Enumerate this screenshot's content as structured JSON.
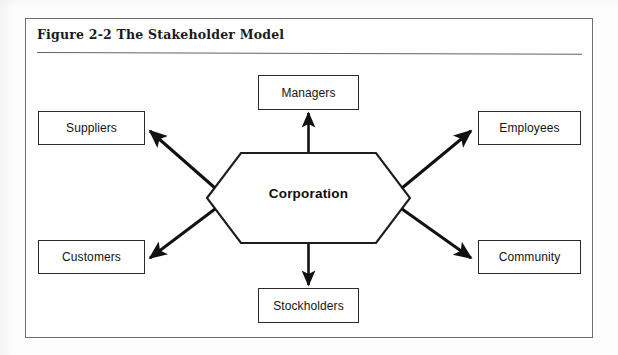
{
  "figure": {
    "title": "Figure 2-2  The Stakeholder Model",
    "center_label": "Corporation"
  },
  "nodes": [
    {
      "id": "managers",
      "label": "Managers"
    },
    {
      "id": "suppliers",
      "label": "Suppliers"
    },
    {
      "id": "employees",
      "label": "Employees"
    },
    {
      "id": "customers",
      "label": "Customers"
    },
    {
      "id": "community",
      "label": "Community"
    },
    {
      "id": "stockholders",
      "label": "Stockholders"
    }
  ],
  "colors": {
    "frame_border": "#6e6e6e",
    "box_border": "#2b2b2b",
    "arrow": "#111111",
    "text": "#141414",
    "page_background": "#fdfdfd"
  }
}
